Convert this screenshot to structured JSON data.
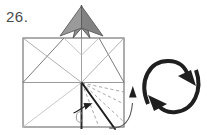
{
  "step": {
    "number_label": "26."
  },
  "diagram": {
    "colors": {
      "paper_fill": "#ffffff",
      "paper_edge": "#6b6b6b",
      "crease_light": "#bdbdbd",
      "crease_mid": "#8f8f8f",
      "fold_line_dark": "#1f1f1f",
      "shaded_flap": "#8d8d8d",
      "shaded_flap_edge": "#5a5a5a",
      "arrow_dark": "#1f1f1f",
      "dashed_crease": "#9a9a9a",
      "number_text": "#4a4a4a"
    },
    "square": {
      "left": 23,
      "top": 38,
      "right": 124,
      "bottom": 127
    },
    "elements": [
      {
        "name": "paper-square-outline",
        "kind": "square",
        "label": "folded paper outline"
      },
      {
        "name": "horizontal-mid-crease",
        "kind": "crease",
        "label": "horizontal mid crease"
      },
      {
        "name": "vertical-center-crease",
        "kind": "crease",
        "label": "vertical center crease"
      },
      {
        "name": "roof-diagonal-left",
        "kind": "crease",
        "label": "left roof diagonal"
      },
      {
        "name": "roof-diagonal-right",
        "kind": "crease",
        "label": "right roof diagonal"
      },
      {
        "name": "upper-left-corner-crease",
        "kind": "crease",
        "label": "upper left corner crease"
      },
      {
        "name": "upper-right-corner-crease",
        "kind": "crease",
        "label": "upper right corner crease"
      },
      {
        "name": "lower-left-diagonal-crease",
        "kind": "crease",
        "label": "lower left diagonal crease"
      },
      {
        "name": "shaded-apex-flap",
        "kind": "flap",
        "label": "shaded point flap above square"
      },
      {
        "name": "dashed-fold-line-1",
        "kind": "dashed",
        "label": "valley fold guide 1"
      },
      {
        "name": "dashed-fold-line-2",
        "kind": "dashed",
        "label": "valley fold guide 2"
      },
      {
        "name": "dashed-fold-line-3",
        "kind": "dashed",
        "label": "valley fold guide 3"
      },
      {
        "name": "dashed-fold-line-4",
        "kind": "dashed",
        "label": "valley fold guide 4"
      },
      {
        "name": "solid-fold-edge",
        "kind": "fold",
        "label": "current flap edge being swung"
      },
      {
        "name": "vertical-dark-edge",
        "kind": "fold",
        "label": "vertical raised edge"
      },
      {
        "name": "fold-direction-arrow",
        "kind": "arrow",
        "label": "small arrow showing fold direction"
      },
      {
        "name": "turn-over-arrow",
        "kind": "arrow",
        "label": "turn model over symbol"
      },
      {
        "name": "turn-over-leader-line",
        "kind": "leader",
        "label": "curved leader from model to turn-over symbol"
      }
    ]
  }
}
